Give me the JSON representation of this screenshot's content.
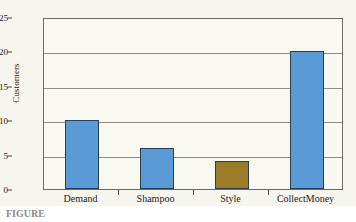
{
  "chart_data": {
    "type": "bar",
    "title": "",
    "subtitle": "",
    "xlabel": "",
    "ylabel": "Customers",
    "categories": [
      "Demand",
      "Shampoo",
      "Style",
      "CollectMoney"
    ],
    "values": [
      10,
      6,
      4,
      20
    ],
    "bar_colors": [
      "#5b9bd5",
      "#5b9bd5",
      "#9a7b26",
      "#5b9bd5"
    ],
    "bar_border_color": "#2b3c55",
    "ylim": [
      0,
      25
    ],
    "yticks": [
      0,
      5,
      10,
      15,
      20,
      25
    ],
    "ytick_labels": [
      "0",
      "5",
      "10",
      "15",
      "20",
      "25"
    ],
    "grid": true,
    "grid_axis": "y",
    "legend": false,
    "legend_position": "none",
    "highlighted_category": "Style",
    "annotations": []
  },
  "figure": {
    "background_color": "#f7f6ee",
    "plot_background_color": "#f9f8f1",
    "frame_color": "#6b6b60",
    "gridline_color": "#8d8d80",
    "caption_prefix": "FIGURE",
    "caption_text": ""
  }
}
